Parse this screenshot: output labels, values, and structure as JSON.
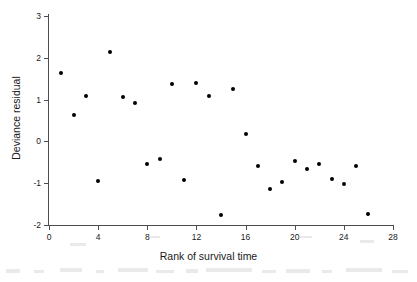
{
  "figure": {
    "background_color": "#ffffff",
    "marker_color": "#000000",
    "axis_color": "#4d4d4d"
  },
  "chart_data": {
    "type": "scatter",
    "title": "",
    "xlabel": "Rank of survival time",
    "ylabel": "Deviance residual",
    "xlim": [
      0,
      28
    ],
    "ylim": [
      -2,
      3
    ],
    "xticks": [
      0,
      4,
      8,
      12,
      16,
      20,
      24,
      28
    ],
    "yticks": [
      3,
      2,
      1,
      0,
      -1,
      -2
    ],
    "xtick_labels": [
      "0",
      "4",
      "8",
      "12",
      "16",
      "20",
      "24",
      "28"
    ],
    "ytick_labels": [
      "3",
      "2",
      "1",
      "0",
      "-1",
      "-2"
    ],
    "grid": false,
    "legend": false,
    "series": [
      {
        "name": "Deviance residuals",
        "marker": "filled-circle",
        "points": [
          {
            "x": 1,
            "y": 1.63
          },
          {
            "x": 2,
            "y": 0.64
          },
          {
            "x": 3,
            "y": 1.08
          },
          {
            "x": 4,
            "y": -0.95
          },
          {
            "x": 5,
            "y": 2.14
          },
          {
            "x": 6,
            "y": 1.06
          },
          {
            "x": 7,
            "y": 0.92
          },
          {
            "x": 8,
            "y": -0.55
          },
          {
            "x": 9,
            "y": -0.42
          },
          {
            "x": 10,
            "y": 1.37
          },
          {
            "x": 11,
            "y": -0.93
          },
          {
            "x": 12,
            "y": 1.39
          },
          {
            "x": 13,
            "y": 1.08
          },
          {
            "x": 14,
            "y": -1.75
          },
          {
            "x": 15,
            "y": 1.26
          },
          {
            "x": 16,
            "y": 0.18
          },
          {
            "x": 17,
            "y": -0.58
          },
          {
            "x": 18,
            "y": -1.13
          },
          {
            "x": 19,
            "y": -0.97
          },
          {
            "x": 20,
            "y": -0.47
          },
          {
            "x": 21,
            "y": -0.66
          },
          {
            "x": 22,
            "y": -0.55
          },
          {
            "x": 23,
            "y": -0.89
          },
          {
            "x": 24,
            "y": -1.03
          },
          {
            "x": 25,
            "y": -0.58
          },
          {
            "x": 26,
            "y": -1.73
          }
        ]
      }
    ]
  }
}
